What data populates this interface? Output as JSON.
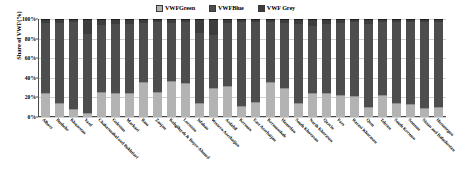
{
  "chart_data": {
    "type": "bar",
    "subtype": "100% stacked bar",
    "title": "",
    "xlabel": "",
    "ylabel": "Share of VWF(%)",
    "ylim": [
      0,
      100
    ],
    "yticks": [
      "0%",
      "20%",
      "40%",
      "60%",
      "80%",
      "100%"
    ],
    "ytick_values": [
      0,
      20,
      40,
      60,
      80,
      100
    ],
    "grid": true,
    "legend_position": "top-center",
    "legend": [
      "VWFGreen",
      "VWFBlue",
      "VWF Grey"
    ],
    "categories": [
      "Alborz",
      "Bushehr",
      "Khuzestan",
      "Yazd",
      "Chaharmahal and Bakhtiari",
      "Golestan",
      "Markazi",
      "Ilam",
      "Zanjan",
      "Kohgiluyeh & Boyer-Ahmad",
      "Lorestan",
      "Isfahan",
      "Western Azerbaijan",
      "Ardabil",
      "Kerman",
      "East Azerbaijan",
      "Kermanshah",
      "Hamedan",
      "South Khorasan",
      "North Khorasan",
      "Qazvin",
      "Fars",
      "Razavi Khorasan",
      "Qom",
      "Tehran",
      "South Kerman",
      "Semnan",
      "Sistan and Baluchestan",
      "Hormozgan"
    ],
    "series": [
      {
        "name": "VWFGreen",
        "color": "#b3b3b3",
        "values": [
          24,
          14,
          8,
          4,
          26,
          24,
          24,
          36,
          26,
          37,
          35,
          14,
          30,
          32,
          11,
          15,
          36,
          30,
          14,
          25,
          25,
          22,
          21,
          10,
          22,
          14,
          13,
          9,
          10
        ]
      },
      {
        "name": "VWFBlue",
        "color": "#4d4d4d",
        "values": [
          72,
          82,
          89,
          81,
          68,
          71,
          71,
          60,
          71,
          59,
          62,
          72,
          54,
          64,
          86,
          82,
          61,
          66,
          81,
          68,
          70,
          74,
          76,
          85,
          75,
          83,
          84,
          88,
          87
        ]
      },
      {
        "name": "VWF Grey",
        "color": "#3d3d3d",
        "values": [
          4,
          4,
          3,
          15,
          6,
          5,
          5,
          4,
          3,
          4,
          3,
          14,
          16,
          4,
          3,
          3,
          3,
          4,
          5,
          7,
          5,
          4,
          3,
          5,
          3,
          3,
          3,
          3,
          3
        ]
      }
    ]
  },
  "legend": {
    "items": [
      {
        "label": "VWFGreen",
        "swatch": "#b3b3b3"
      },
      {
        "label": "VWFBlue",
        "swatch": "#4d4d4d"
      },
      {
        "label": "VWF Grey",
        "swatch": "#3d3d3d"
      }
    ]
  },
  "axes": {
    "y_title": "Share of VWF(%)"
  }
}
